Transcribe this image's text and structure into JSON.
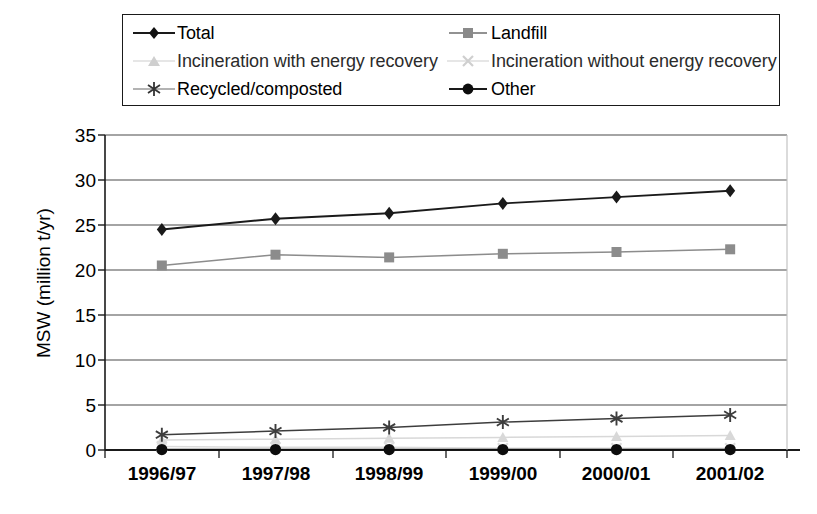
{
  "chart_data": {
    "type": "line",
    "title": "",
    "xlabel": "",
    "ylabel": "MSW (million t/yr)",
    "categories": [
      "1996/97",
      "1997/98",
      "1998/99",
      "1999/00",
      "2000/01",
      "2001/02"
    ],
    "ylim": [
      0,
      35
    ],
    "yticks": [
      0,
      5,
      10,
      15,
      20,
      25,
      30,
      35
    ],
    "grid": true,
    "legend_position": "top",
    "series": [
      {
        "name": "Total",
        "marker": "diamond",
        "color": "#1a1a1a",
        "values": [
          24.5,
          25.7,
          26.3,
          27.4,
          28.1,
          28.8
        ]
      },
      {
        "name": "Landfill",
        "marker": "square",
        "color": "#8c8c8c",
        "values": [
          20.5,
          21.7,
          21.4,
          21.8,
          22.0,
          22.3
        ]
      },
      {
        "name": "Incineration with energy recovery",
        "marker": "triangle",
        "color": "#d8d8d8",
        "values": [
          1.1,
          1.2,
          1.3,
          1.4,
          1.5,
          1.6
        ]
      },
      {
        "name": "Incineration without energy recovery",
        "marker": "cross",
        "color": "#dcdcdc",
        "values": [
          0.4,
          0.3,
          0.3,
          0.2,
          0.2,
          0.2
        ]
      },
      {
        "name": "Recycled/composted",
        "marker": "asterisk",
        "color": "#3d3d3d",
        "values": [
          1.7,
          2.1,
          2.5,
          3.1,
          3.5,
          3.9
        ]
      },
      {
        "name": "Other",
        "marker": "circle",
        "color": "#0d0d0d",
        "values": [
          0.05,
          0.05,
          0.05,
          0.05,
          0.05,
          0.05
        ]
      }
    ]
  },
  "legend": {
    "rows": [
      {
        "left": "Total",
        "right": "Landfill"
      },
      {
        "left": "Incineration with energy recovery",
        "right": "Incineration without energy recovery"
      },
      {
        "left": "Recycled/composted",
        "right": "Other"
      }
    ]
  },
  "axis": {
    "y_title": "MSW (million t/yr)",
    "y_ticks": [
      "35",
      "30",
      "25",
      "20",
      "15",
      "10",
      "5",
      "0"
    ],
    "x_ticks": [
      "1996/97",
      "1997/98",
      "1998/99",
      "1999/00",
      "2000/01",
      "2001/02"
    ]
  }
}
